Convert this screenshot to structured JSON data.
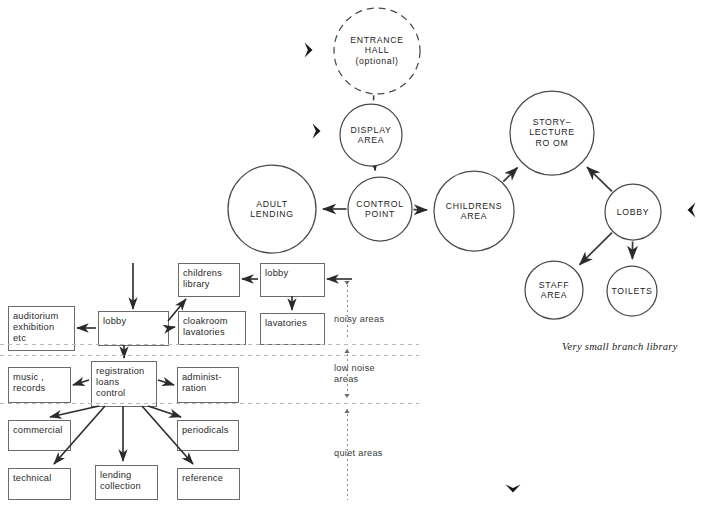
{
  "diagram": {
    "caption": "Very small branch library",
    "colors": {
      "stroke": "#4a4a4a",
      "text": "#1d1d1d",
      "bold_arrow": "#171717",
      "zone_divider": "#b9b9b9"
    },
    "bubble_nodes": [
      {
        "id": "entrance-hall",
        "label": "ENTRANCE\nHALL\n(optional)",
        "cx": 377,
        "cy": 51,
        "r": 43,
        "dashed": true
      },
      {
        "id": "display-area",
        "label": "DISPLAY\nAREA",
        "cx": 371,
        "cy": 135,
        "r": 31,
        "dashed": false
      },
      {
        "id": "adult-lending",
        "label": "ADULT\nLENDING",
        "cx": 272,
        "cy": 209,
        "r": 44,
        "dashed": false
      },
      {
        "id": "control-point",
        "label": "CONTROL\nPOINT",
        "cx": 380,
        "cy": 209,
        "r": 32,
        "dashed": false
      },
      {
        "id": "childrens-area",
        "label": "CHILDRENS\nAREA",
        "cx": 474,
        "cy": 211,
        "r": 40,
        "dashed": false
      },
      {
        "id": "story-lecture-room",
        "label": "STORY–\nLECTURE\nRO OM",
        "cx": 552,
        "cy": 133,
        "r": 42,
        "dashed": false
      },
      {
        "id": "lobby-circle",
        "label": "LOBBY",
        "cx": 633,
        "cy": 212,
        "r": 28,
        "dashed": false
      },
      {
        "id": "staff-area",
        "label": "STAFF\nAREA",
        "cx": 554,
        "cy": 290,
        "r": 29,
        "dashed": false
      },
      {
        "id": "toilets",
        "label": "TOILETS",
        "cx": 632,
        "cy": 291,
        "r": 25,
        "dashed": false
      }
    ],
    "bubble_links": [
      {
        "from": "entrance-hall",
        "to": "display-area",
        "style": "dashed",
        "arrow": false
      },
      {
        "from": "display-area",
        "to": "control-point",
        "style": "solid",
        "arrow": true
      },
      {
        "from": "control-point",
        "to": "adult-lending",
        "style": "solid",
        "arrow": true
      },
      {
        "from": "control-point",
        "to": "childrens-area",
        "style": "solid",
        "arrow": true
      },
      {
        "from": "childrens-area",
        "to": "story-lecture-room",
        "style": "solid",
        "arrow": true
      },
      {
        "from": "lobby-circle",
        "to": "story-lecture-room",
        "style": "solid",
        "arrow": true
      },
      {
        "from": "lobby-circle",
        "to": "staff-area",
        "style": "solid",
        "arrow": true
      },
      {
        "from": "lobby-circle",
        "to": "toilets",
        "style": "solid",
        "arrow": true
      }
    ],
    "entry_markers": [
      {
        "id": "entry-marker-entrance-hall",
        "x": 314,
        "y": 50,
        "direction": "right"
      },
      {
        "id": "entry-marker-display-area",
        "x": 322,
        "y": 131,
        "direction": "right"
      },
      {
        "id": "entry-marker-lobby",
        "x": 686,
        "y": 210,
        "direction": "left"
      },
      {
        "id": "entry-marker-bottom",
        "x": 513,
        "y": 494,
        "direction": "down"
      }
    ],
    "boxes": [
      {
        "id": "childrens-library",
        "label": "childrens\nlibrary",
        "x": 178,
        "y": 263,
        "w": 61,
        "h": 33
      },
      {
        "id": "lobby-box-right",
        "label": "lobby",
        "x": 260,
        "y": 263,
        "w": 64,
        "h": 33
      },
      {
        "id": "auditorium",
        "label": "auditorium\nexhibition\netc",
        "x": 8,
        "y": 306,
        "w": 66,
        "h": 44
      },
      {
        "id": "lobby-box-left",
        "label": "lobby",
        "x": 98,
        "y": 311,
        "w": 70,
        "h": 34
      },
      {
        "id": "cloakroom",
        "label": "cloakroom\nlavatories",
        "x": 178,
        "y": 311,
        "w": 67,
        "h": 33
      },
      {
        "id": "lavatories",
        "label": "lavatories",
        "x": 260,
        "y": 313,
        "w": 64,
        "h": 31
      },
      {
        "id": "registration",
        "label": "registration\nloans\ncontrol",
        "x": 91,
        "y": 361,
        "w": 65,
        "h": 45
      },
      {
        "id": "music-records",
        "label": "music ,\nrecords",
        "x": 8,
        "y": 367,
        "w": 62,
        "h": 35
      },
      {
        "id": "administration",
        "label": "administ-\nration",
        "x": 177,
        "y": 367,
        "w": 61,
        "h": 35
      },
      {
        "id": "commercial",
        "label": "commercial",
        "x": 8,
        "y": 420,
        "w": 62,
        "h": 30
      },
      {
        "id": "periodicals",
        "label": "periodicals",
        "x": 177,
        "y": 420,
        "w": 61,
        "h": 30
      },
      {
        "id": "technical",
        "label": "technical",
        "x": 8,
        "y": 468,
        "w": 62,
        "h": 31
      },
      {
        "id": "lending-collection",
        "label": "lending\ncollection",
        "x": 95,
        "y": 465,
        "w": 62,
        "h": 34
      },
      {
        "id": "reference",
        "label": "reference",
        "x": 177,
        "y": 468,
        "w": 62,
        "h": 31
      }
    ],
    "zones": [
      {
        "id": "zone-noisy",
        "label": "noisy areas",
        "x": 334,
        "y": 314
      },
      {
        "id": "zone-low-noise",
        "label": "low noise\nareas",
        "x": 334,
        "y": 363
      },
      {
        "id": "zone-quiet",
        "label": "quiet areas",
        "x": 334,
        "y": 448
      }
    ],
    "zone_dividers": [
      344,
      355,
      403
    ],
    "zone_axis": {
      "x": 347,
      "y_top": 285,
      "y_bottom": 500
    }
  }
}
